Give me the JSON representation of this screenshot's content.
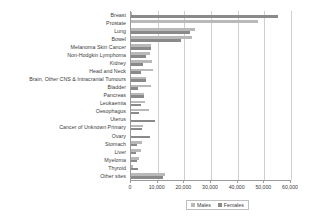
{
  "chart_data": {
    "type": "bar",
    "orientation": "horizontal",
    "title": "",
    "subtitle": "",
    "xlabel": "",
    "ylabel": "",
    "xlim": [
      0,
      60000
    ],
    "grid": true,
    "legend_position": "bottom",
    "xticks": [
      0,
      10000,
      20000,
      30000,
      40000,
      50000,
      60000
    ],
    "xticklabels": [
      "0",
      "10,000",
      "20,000",
      "30,000",
      "40,000",
      "50,000",
      "60,000"
    ],
    "categories": [
      "Breast",
      "Prostate",
      "Lung",
      "Bowel",
      "Melanoma Skin Cancer",
      "Non-Hodgkin Lymphoma",
      "Kidney",
      "Head and Neck",
      "Brain, Other CNS & Intracranial Tumours",
      "Bladder",
      "Pancreas",
      "Leukaemia",
      "Oesophagus",
      "Uterus",
      "Cancer of Unknown Primary",
      "Ovary",
      "Stomach",
      "Liver",
      "Myeloma",
      "Thyroid",
      "Other sites"
    ],
    "series": [
      {
        "name": "Males",
        "color": "#b9b9b9",
        "values": [
          350,
          47700,
          24000,
          23000,
          7400,
          7000,
          7900,
          8200,
          5700,
          7500,
          4700,
          5400,
          6700,
          0,
          4400,
          0,
          4100,
          3600,
          3000,
          900,
          12700
        ]
      },
      {
        "name": "Females",
        "color": "#8a8a8a",
        "values": [
          55000,
          0,
          22000,
          18800,
          7400,
          5700,
          4600,
          3800,
          5600,
          2800,
          4800,
          3900,
          2900,
          9000,
          4300,
          7300,
          2400,
          1900,
          2400,
          2600,
          12100
        ]
      }
    ]
  },
  "legend": {
    "items": [
      {
        "label": "Males",
        "color": "#b9b9b9"
      },
      {
        "label": "Females",
        "color": "#8a8a8a"
      }
    ]
  }
}
